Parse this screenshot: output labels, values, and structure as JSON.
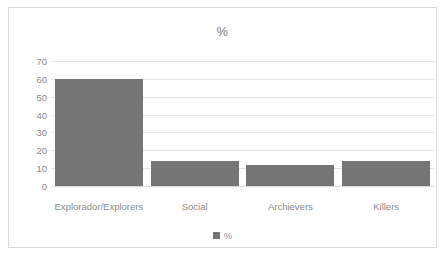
{
  "chart_data": {
    "type": "bar",
    "title": "%",
    "xlabel": "",
    "ylabel": "",
    "categories": [
      "Explorador/Explorers",
      "Social",
      "Archievers",
      "Killers"
    ],
    "values": [
      60,
      14,
      12,
      14
    ],
    "series": [
      {
        "name": "%",
        "values": [
          60,
          14,
          12,
          14
        ]
      }
    ],
    "ylim": [
      0,
      70
    ],
    "yticks": [
      70,
      60,
      50,
      40,
      30,
      20,
      10,
      0
    ],
    "grid": true,
    "legend": {
      "position": "bottom",
      "entries": [
        {
          "label": "%",
          "marker": "square-swatch",
          "color": "#757575"
        }
      ]
    },
    "colors": {
      "bar": "#757575",
      "gridline": "#e4e4e4",
      "axis_text": "#8a8a8a",
      "title_text": "#7b7b7b",
      "frame_border": "#d9d9d9",
      "background": "#ffffff"
    }
  }
}
